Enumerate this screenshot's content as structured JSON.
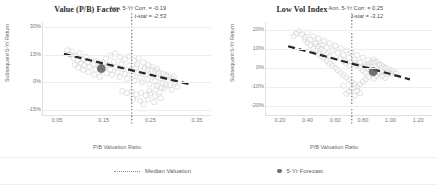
{
  "figure": {
    "background": "#ffffff",
    "scatter_color": "#d9d9d9",
    "trend_color": "#262626",
    "median_color": "#7f7f7f",
    "forecast_color": "#5a5a5a"
  },
  "legend": {
    "items": [
      {
        "label": "Median Valuation",
        "marker": "dotted-line-icon"
      },
      {
        "label": "5-Yr Forecast",
        "marker": "filled-circle-icon"
      }
    ]
  },
  "chart_data": [
    {
      "type": "scatter",
      "title": "Value (P/B) Factor",
      "xlabel": "P/B Valuation Ratio",
      "ylabel": "Subsequent 5-Yr Return",
      "xlim": [
        0.02,
        0.38
      ],
      "ylim": [
        -0.18,
        0.33
      ],
      "xticks": [
        0.05,
        0.15,
        0.25,
        0.35
      ],
      "xtick_labels": [
        "0.05",
        "0.15",
        "0.25",
        "0.35"
      ],
      "yticks": [
        0.3,
        0.15,
        0.0,
        -0.15
      ],
      "ytick_labels": [
        "30%",
        "15%",
        "0%",
        "-15%"
      ],
      "grid": "horizontal",
      "annotations": [
        "Ann. 5-Yr Corr. = -0.19",
        "t-stat = -2.53"
      ],
      "stats": {
        "correlation": -0.19,
        "t_stat": -2.53
      },
      "median_valuation": 0.21,
      "forecast_point": {
        "x": 0.145,
        "y": 0.075
      },
      "trendline": {
        "x0": 0.065,
        "y0": 0.155,
        "x1": 0.335,
        "y1": -0.012
      },
      "points": [
        {
          "x": 0.072,
          "y": 0.175
        },
        {
          "x": 0.078,
          "y": 0.152
        },
        {
          "x": 0.082,
          "y": 0.168
        },
        {
          "x": 0.086,
          "y": 0.131
        },
        {
          "x": 0.09,
          "y": 0.145
        },
        {
          "x": 0.094,
          "y": 0.118
        },
        {
          "x": 0.098,
          "y": 0.16
        },
        {
          "x": 0.101,
          "y": 0.104
        },
        {
          "x": 0.105,
          "y": 0.126
        },
        {
          "x": 0.108,
          "y": 0.092
        },
        {
          "x": 0.112,
          "y": 0.14
        },
        {
          "x": 0.116,
          "y": 0.11
        },
        {
          "x": 0.12,
          "y": 0.085
        },
        {
          "x": 0.124,
          "y": 0.122
        },
        {
          "x": 0.128,
          "y": 0.098
        },
        {
          "x": 0.132,
          "y": 0.07
        },
        {
          "x": 0.136,
          "y": 0.115
        },
        {
          "x": 0.14,
          "y": 0.088
        },
        {
          "x": 0.144,
          "y": 0.062
        },
        {
          "x": 0.148,
          "y": 0.105
        },
        {
          "x": 0.152,
          "y": 0.078
        },
        {
          "x": 0.156,
          "y": 0.05
        },
        {
          "x": 0.16,
          "y": 0.095
        },
        {
          "x": 0.164,
          "y": 0.068
        },
        {
          "x": 0.168,
          "y": 0.04
        },
        {
          "x": 0.172,
          "y": 0.112
        },
        {
          "x": 0.176,
          "y": 0.082
        },
        {
          "x": 0.18,
          "y": 0.055
        },
        {
          "x": 0.184,
          "y": 0.028
        },
        {
          "x": 0.188,
          "y": 0.1
        },
        {
          "x": 0.192,
          "y": 0.072
        },
        {
          "x": 0.196,
          "y": 0.045
        },
        {
          "x": 0.2,
          "y": 0.018
        },
        {
          "x": 0.204,
          "y": 0.09
        },
        {
          "x": 0.208,
          "y": 0.062
        },
        {
          "x": 0.212,
          "y": 0.035
        },
        {
          "x": 0.216,
          "y": 0.008
        },
        {
          "x": 0.22,
          "y": 0.08
        },
        {
          "x": 0.224,
          "y": 0.052
        },
        {
          "x": 0.228,
          "y": 0.025
        },
        {
          "x": 0.232,
          "y": -0.002
        },
        {
          "x": 0.236,
          "y": 0.07
        },
        {
          "x": 0.24,
          "y": 0.042
        },
        {
          "x": 0.244,
          "y": 0.015
        },
        {
          "x": 0.248,
          "y": -0.012
        },
        {
          "x": 0.252,
          "y": 0.06
        },
        {
          "x": 0.256,
          "y": 0.032
        },
        {
          "x": 0.26,
          "y": 0.005
        },
        {
          "x": 0.264,
          "y": -0.022
        },
        {
          "x": 0.268,
          "y": 0.05
        },
        {
          "x": 0.272,
          "y": 0.022
        },
        {
          "x": 0.276,
          "y": -0.005
        },
        {
          "x": 0.28,
          "y": -0.032
        },
        {
          "x": 0.284,
          "y": 0.04
        },
        {
          "x": 0.288,
          "y": 0.012
        },
        {
          "x": 0.292,
          "y": -0.015
        },
        {
          "x": 0.296,
          "y": -0.042
        },
        {
          "x": 0.3,
          "y": 0.03
        },
        {
          "x": 0.304,
          "y": 0.002
        },
        {
          "x": 0.308,
          "y": -0.025
        },
        {
          "x": 0.155,
          "y": 0.13
        },
        {
          "x": 0.165,
          "y": 0.145
        },
        {
          "x": 0.175,
          "y": 0.158
        },
        {
          "x": 0.185,
          "y": 0.138
        },
        {
          "x": 0.195,
          "y": 0.125
        },
        {
          "x": 0.205,
          "y": 0.142
        },
        {
          "x": 0.215,
          "y": 0.118
        },
        {
          "x": 0.225,
          "y": 0.132
        },
        {
          "x": 0.235,
          "y": 0.108
        },
        {
          "x": 0.245,
          "y": 0.095
        },
        {
          "x": 0.255,
          "y": 0.085
        },
        {
          "x": 0.265,
          "y": 0.072
        },
        {
          "x": 0.19,
          "y": -0.048
        },
        {
          "x": 0.2,
          "y": -0.06
        },
        {
          "x": 0.21,
          "y": -0.052
        },
        {
          "x": 0.22,
          "y": -0.068
        },
        {
          "x": 0.23,
          "y": -0.058
        },
        {
          "x": 0.24,
          "y": -0.072
        },
        {
          "x": 0.25,
          "y": -0.062
        },
        {
          "x": 0.26,
          "y": -0.078
        },
        {
          "x": 0.27,
          "y": -0.055
        },
        {
          "x": 0.213,
          "y": -0.092
        },
        {
          "x": 0.228,
          "y": -0.102
        },
        {
          "x": 0.245,
          "y": -0.095
        },
        {
          "x": 0.258,
          "y": -0.11
        },
        {
          "x": 0.272,
          "y": -0.088
        },
        {
          "x": 0.236,
          "y": -0.122
        },
        {
          "x": 0.13,
          "y": 0.042
        },
        {
          "x": 0.142,
          "y": 0.03
        },
        {
          "x": 0.118,
          "y": 0.055
        },
        {
          "x": 0.106,
          "y": 0.068
        },
        {
          "x": 0.096,
          "y": 0.08
        },
        {
          "x": 0.088,
          "y": 0.095
        },
        {
          "x": 0.222,
          "y": 0.095
        },
        {
          "x": 0.238,
          "y": 0.082
        },
        {
          "x": 0.252,
          "y": 0.07
        },
        {
          "x": 0.266,
          "y": 0.058
        },
        {
          "x": 0.278,
          "y": 0.045
        },
        {
          "x": 0.288,
          "y": 0.03
        },
        {
          "x": 0.296,
          "y": 0.018
        },
        {
          "x": 0.302,
          "y": -0.008
        },
        {
          "x": 0.284,
          "y": -0.018
        },
        {
          "x": 0.274,
          "y": -0.03
        },
        {
          "x": 0.262,
          "y": -0.04
        },
        {
          "x": 0.248,
          "y": -0.048
        }
      ]
    },
    {
      "type": "scatter",
      "title": "Low Vol Index",
      "xlabel": "P/B Valuation Ratio",
      "ylabel": "Subsequent 5-Yr Return",
      "xlim": [
        0.1,
        1.3
      ],
      "ylim": [
        -0.25,
        0.24
      ],
      "xticks": [
        0.2,
        0.4,
        0.6,
        0.8,
        1.0,
        1.2
      ],
      "xtick_labels": [
        "0.20",
        "0.40",
        "0.60",
        "0.80",
        "1.00",
        "1.20"
      ],
      "yticks": [
        0.2,
        0.1,
        0.0,
        -0.1,
        -0.2
      ],
      "ytick_labels": [
        "20%",
        "10%",
        "0%",
        "-10%",
        "-20%"
      ],
      "grid": "horizontal",
      "annotations": [
        "Ann. 5-Yr Corr. = 0.25",
        "t-stat = -3.12"
      ],
      "stats": {
        "correlation": 0.25,
        "t_stat": -3.12
      },
      "median_valuation": 0.72,
      "forecast_point": {
        "x": 0.875,
        "y": -0.022
      },
      "trendline": {
        "x0": 0.26,
        "y0": 0.112,
        "x1": 1.14,
        "y1": -0.062
      },
      "points": [
        {
          "x": 0.36,
          "y": 0.175
        },
        {
          "x": 0.38,
          "y": 0.16
        },
        {
          "x": 0.4,
          "y": 0.185
        },
        {
          "x": 0.42,
          "y": 0.148
        },
        {
          "x": 0.44,
          "y": 0.165
        },
        {
          "x": 0.46,
          "y": 0.132
        },
        {
          "x": 0.48,
          "y": 0.152
        },
        {
          "x": 0.5,
          "y": 0.118
        },
        {
          "x": 0.52,
          "y": 0.14
        },
        {
          "x": 0.54,
          "y": 0.105
        },
        {
          "x": 0.56,
          "y": 0.128
        },
        {
          "x": 0.58,
          "y": 0.092
        },
        {
          "x": 0.6,
          "y": 0.115
        },
        {
          "x": 0.62,
          "y": 0.078
        },
        {
          "x": 0.64,
          "y": 0.102
        },
        {
          "x": 0.66,
          "y": 0.065
        },
        {
          "x": 0.68,
          "y": 0.09
        },
        {
          "x": 0.7,
          "y": 0.052
        },
        {
          "x": 0.72,
          "y": 0.078
        },
        {
          "x": 0.74,
          "y": 0.04
        },
        {
          "x": 0.76,
          "y": 0.065
        },
        {
          "x": 0.78,
          "y": 0.028
        },
        {
          "x": 0.8,
          "y": 0.052
        },
        {
          "x": 0.82,
          "y": 0.015
        },
        {
          "x": 0.84,
          "y": 0.04
        },
        {
          "x": 0.86,
          "y": 0.002
        },
        {
          "x": 0.88,
          "y": 0.028
        },
        {
          "x": 0.9,
          "y": -0.01
        },
        {
          "x": 0.92,
          "y": 0.015
        },
        {
          "x": 0.94,
          "y": -0.022
        },
        {
          "x": 0.96,
          "y": 0.002
        },
        {
          "x": 0.98,
          "y": -0.035
        },
        {
          "x": 1.0,
          "y": -0.012
        },
        {
          "x": 0.34,
          "y": 0.192
        },
        {
          "x": 0.32,
          "y": 0.178
        },
        {
          "x": 0.3,
          "y": 0.165
        },
        {
          "x": 0.44,
          "y": 0.098
        },
        {
          "x": 0.46,
          "y": 0.085
        },
        {
          "x": 0.48,
          "y": 0.072
        },
        {
          "x": 0.5,
          "y": 0.06
        },
        {
          "x": 0.52,
          "y": 0.048
        },
        {
          "x": 0.54,
          "y": 0.035
        },
        {
          "x": 0.56,
          "y": 0.022
        },
        {
          "x": 0.58,
          "y": 0.01
        },
        {
          "x": 0.6,
          "y": -0.002
        },
        {
          "x": 0.62,
          "y": -0.015
        },
        {
          "x": 0.64,
          "y": -0.028
        },
        {
          "x": 0.66,
          "y": -0.04
        },
        {
          "x": 0.68,
          "y": -0.052
        },
        {
          "x": 0.7,
          "y": -0.065
        },
        {
          "x": 0.72,
          "y": -0.078
        },
        {
          "x": 0.74,
          "y": -0.09
        },
        {
          "x": 0.76,
          "y": -0.102
        },
        {
          "x": 0.78,
          "y": -0.088
        },
        {
          "x": 0.8,
          "y": -0.075
        },
        {
          "x": 0.82,
          "y": -0.062
        },
        {
          "x": 0.84,
          "y": -0.048
        },
        {
          "x": 0.86,
          "y": -0.035
        },
        {
          "x": 0.88,
          "y": -0.058
        },
        {
          "x": 0.9,
          "y": -0.045
        },
        {
          "x": 0.64,
          "y": 0.048
        },
        {
          "x": 0.66,
          "y": 0.035
        },
        {
          "x": 0.68,
          "y": 0.022
        },
        {
          "x": 0.7,
          "y": 0.01
        },
        {
          "x": 0.74,
          "y": 0.022
        },
        {
          "x": 0.76,
          "y": 0.01
        },
        {
          "x": 0.78,
          "y": -0.002
        },
        {
          "x": 0.8,
          "y": -0.015
        },
        {
          "x": 0.82,
          "y": -0.028
        },
        {
          "x": 0.84,
          "y": 0.015
        },
        {
          "x": 0.86,
          "y": 0.028
        },
        {
          "x": 0.88,
          "y": 0.042
        },
        {
          "x": 0.9,
          "y": 0.03
        },
        {
          "x": 0.92,
          "y": 0.018
        },
        {
          "x": 0.94,
          "y": 0.008
        },
        {
          "x": 0.96,
          "y": -0.005
        },
        {
          "x": 0.98,
          "y": -0.018
        },
        {
          "x": 1.0,
          "y": -0.03
        },
        {
          "x": 1.02,
          "y": -0.018
        },
        {
          "x": 1.04,
          "y": -0.03
        },
        {
          "x": 0.72,
          "y": -0.112
        },
        {
          "x": 0.7,
          "y": -0.125
        },
        {
          "x": 0.68,
          "y": -0.138
        },
        {
          "x": 0.74,
          "y": -0.148
        },
        {
          "x": 0.66,
          "y": -0.095
        },
        {
          "x": 0.76,
          "y": -0.122
        },
        {
          "x": 0.78,
          "y": -0.135
        },
        {
          "x": 0.56,
          "y": 0.06
        },
        {
          "x": 0.54,
          "y": 0.072
        },
        {
          "x": 0.52,
          "y": 0.085
        },
        {
          "x": 0.5,
          "y": 0.098
        },
        {
          "x": 0.48,
          "y": 0.112
        },
        {
          "x": 0.46,
          "y": 0.125
        },
        {
          "x": 0.42,
          "y": 0.118
        },
        {
          "x": 0.4,
          "y": 0.132
        },
        {
          "x": 0.38,
          "y": 0.145
        },
        {
          "x": 0.92,
          "y": -0.032
        },
        {
          "x": 0.94,
          "y": -0.045
        },
        {
          "x": 0.96,
          "y": -0.055
        },
        {
          "x": 0.86,
          "y": -0.015
        },
        {
          "x": 0.84,
          "y": -0.005
        },
        {
          "x": 0.82,
          "y": 0.005
        }
      ]
    }
  ]
}
